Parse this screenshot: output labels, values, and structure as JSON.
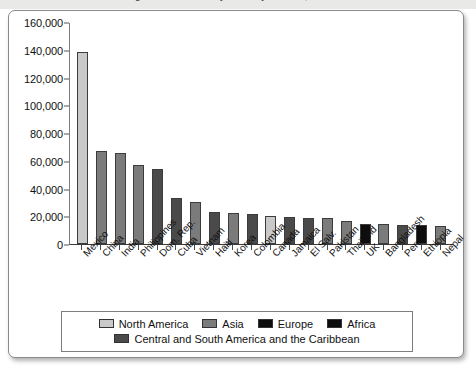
{
  "title_strip": {
    "text": "Immigrants Admitted by Country of Birth, Fiscal Year"
  },
  "chart_data": {
    "type": "bar",
    "title": "",
    "xlabel": "",
    "ylabel": "",
    "ylim": [
      0,
      160000
    ],
    "ytick_values": [
      0,
      20000,
      40000,
      60000,
      80000,
      100000,
      120000,
      140000,
      160000
    ],
    "ytick_labels": [
      "0",
      "20,000",
      "40,000",
      "60,000",
      "80,000",
      "100,000",
      "120,000",
      "140,000",
      "160,000"
    ],
    "grid": false,
    "legend_position": "bottom",
    "categories": [
      "Mexico",
      "China",
      "India",
      "Philippines",
      "Dom. Rep.",
      "Cuba",
      "Vietnam",
      "Haiti",
      "Korea",
      "Colombia",
      "Canada",
      "Jamaica",
      "El Salv.",
      "Pakistan",
      "Thailand",
      "UK",
      "Bangladesh",
      "Peru",
      "Ethiopia",
      "Nepal"
    ],
    "values": [
      139000,
      67500,
      66000,
      57000,
      54000,
      33000,
      30500,
      23000,
      22500,
      21500,
      20000,
      19500,
      19000,
      18500,
      16500,
      14500,
      14500,
      14000,
      13500,
      13000
    ],
    "groups": [
      "North America",
      "Asia",
      "Asia",
      "Asia",
      "Central and South America and the Caribbean",
      "Central and South America and the Caribbean",
      "Asia",
      "Central and South America and the Caribbean",
      "Asia",
      "Central and South America and the Caribbean",
      "North America",
      "Central and South America and the Caribbean",
      "Central and South America and the Caribbean",
      "Asia",
      "Asia",
      "Europe",
      "Asia",
      "Central and South America and the Caribbean",
      "Africa",
      "Asia"
    ],
    "legend": [
      {
        "label": "North America",
        "color": "#c9c9c9"
      },
      {
        "label": "Asia",
        "color": "#7b7b7b"
      },
      {
        "label": "Europe",
        "color": "#0d0d0d"
      },
      {
        "label": "Africa",
        "color": "#0d0d0d"
      },
      {
        "label": "Central and South America and the Caribbean",
        "color": "#4a4a4a"
      }
    ],
    "group_colors": {
      "North America": "#c9c9c9",
      "Asia": "#7b7b7b",
      "Europe": "#0d0d0d",
      "Africa": "#0d0d0d",
      "Central and South America and the Caribbean": "#4a4a4a"
    }
  }
}
